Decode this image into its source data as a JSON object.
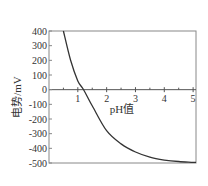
{
  "chart_data": {
    "type": "line",
    "title": "",
    "xlabel": "pH值",
    "ylabel": "电势/mV",
    "xlim": [
      0,
      5.1
    ],
    "ylim": [
      -500,
      400
    ],
    "x_ticks": [
      1,
      2,
      3,
      4,
      5
    ],
    "x_minor_ticks": [
      0.5,
      1.5,
      2.5,
      3.5,
      4.5
    ],
    "y_ticks": [
      400,
      300,
      200,
      100,
      0,
      -100,
      -200,
      -300,
      -400,
      -500
    ],
    "x_tick_labels": [
      "1",
      "2",
      "3",
      "4",
      "5"
    ],
    "y_tick_labels": [
      "400",
      "300",
      "200",
      "100",
      "0",
      "-100",
      "-200",
      "-300",
      "-400",
      "-500"
    ],
    "grid": false,
    "legend": null,
    "x_axis_at_y": 0,
    "series": [
      {
        "name": "电势",
        "x": [
          0.5,
          0.75,
          1.0,
          1.2,
          1.5,
          2.0,
          2.5,
          3.0,
          3.5,
          4.0,
          4.5,
          5.0,
          5.1
        ],
        "values": [
          400,
          200,
          60,
          0,
          -110,
          -280,
          -370,
          -425,
          -460,
          -480,
          -490,
          -495,
          -495
        ]
      }
    ],
    "colors": {
      "line": "#333333",
      "frame": "#888888",
      "zero_line": "#555555"
    }
  }
}
